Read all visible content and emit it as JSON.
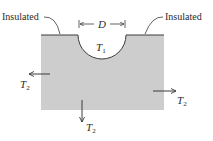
{
  "diagram": {
    "type": "heat-conduction-schematic",
    "labels": {
      "insulated_left": "Insulated",
      "insulated_right": "Insulated",
      "diameter": "D",
      "inner_temp_symbol": "T",
      "inner_temp_sub": "1",
      "outer_temp_symbol": "T",
      "outer_temp_sub": "2"
    },
    "colors": {
      "medium_fill": "#cdcdcd",
      "line": "#3a3a3a",
      "text": "#2a2a2a",
      "background": "#ffffff"
    },
    "arrows": [
      {
        "direction": "left",
        "label": "T2"
      },
      {
        "direction": "right",
        "label": "T2"
      },
      {
        "direction": "down",
        "label": "T2"
      }
    ]
  }
}
